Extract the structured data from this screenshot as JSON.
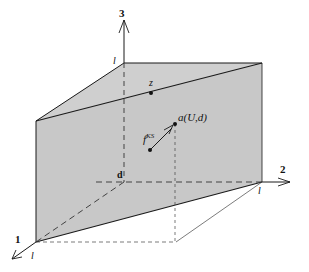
{
  "diagram": {
    "type": "3d-coordinate-plane",
    "axes": [
      {
        "id": "axis-1",
        "label": "1",
        "tick_label": "l"
      },
      {
        "id": "axis-2",
        "label": "2",
        "tick_label": "l"
      },
      {
        "id": "axis-3",
        "label": "3",
        "tick_label": "l"
      }
    ],
    "origin_label": "d",
    "points": {
      "z": "z",
      "a": "a(U,d)",
      "f_base": "f",
      "f_sup": "KS"
    },
    "colors": {
      "plane_fill": "#c8c8c8",
      "line": "#1a1a1a",
      "dashed": "#333333",
      "background": "#ffffff"
    }
  }
}
